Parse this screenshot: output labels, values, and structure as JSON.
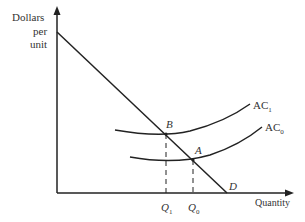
{
  "diagram": {
    "y_axis_label": [
      "Dollars",
      "per",
      "unit"
    ],
    "x_axis_label": "Quantity",
    "curves": {
      "demand": {
        "label": "D"
      },
      "ac1": {
        "label": "AC",
        "sub": "1"
      },
      "ac0": {
        "label": "AC",
        "sub": "0"
      }
    },
    "points": {
      "b": {
        "label": "B"
      },
      "a": {
        "label": "A"
      }
    },
    "quantities": {
      "q1": {
        "label": "Q",
        "sub": "1"
      },
      "q0": {
        "label": "Q",
        "sub": "0"
      }
    },
    "colors": {
      "line": "#222222",
      "text": "#333333"
    }
  }
}
